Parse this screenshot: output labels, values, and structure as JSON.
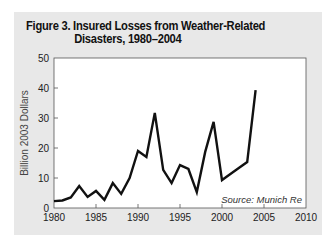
{
  "chart_data": {
    "type": "line",
    "title_line1": "Figure 3. Insured Losses from Weather-Related",
    "title_line2": "Disasters, 1980–2004",
    "xlabel": "",
    "ylabel": "Billion 2003 Dollars",
    "source": "Source: Munich Re",
    "xlim": [
      1980,
      2010
    ],
    "ylim": [
      0,
      50
    ],
    "xticks": [
      1980,
      1985,
      1990,
      1995,
      2000,
      2005,
      2010
    ],
    "yticks": [
      0,
      10,
      20,
      30,
      40,
      50
    ],
    "grid": false,
    "series": [
      {
        "name": "Insured Losses",
        "x": [
          1980,
          1981,
          1982,
          1983,
          1984,
          1985,
          1986,
          1987,
          1988,
          1989,
          1990,
          1991,
          1992,
          1993,
          1994,
          1995,
          1996,
          1997,
          1998,
          1999,
          2000,
          2001,
          2002,
          2003,
          2004
        ],
        "values": [
          2.3,
          2.5,
          3.5,
          7.3,
          3.7,
          5.7,
          2.7,
          8.3,
          4.7,
          10,
          19,
          17,
          31.7,
          12.7,
          8.3,
          14.3,
          13,
          5.3,
          18.7,
          28.7,
          9.3,
          11.3,
          13.3,
          15.3,
          39.3
        ]
      }
    ]
  }
}
